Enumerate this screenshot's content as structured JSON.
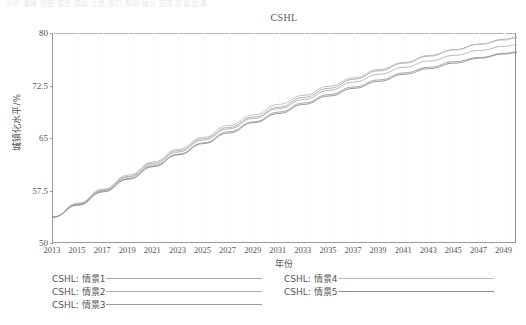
{
  "window": {
    "top_strip_text": "文件  编辑  视图  模型  模拟  工具  窗口  帮助                    输出  图表  变量  结果"
  },
  "chart_data": {
    "type": "line",
    "title": "CSHL",
    "xlabel": "年份",
    "ylabel": "城镇化水平/%",
    "xlim": [
      2013,
      2050
    ],
    "ylim": [
      50,
      80
    ],
    "yticks": [
      50,
      57.5,
      65,
      72.5,
      80
    ],
    "ytick_labels": [
      "50",
      "57.5",
      "65",
      "72.5",
      "80"
    ],
    "xticks": [
      2013,
      2015,
      2017,
      2019,
      2021,
      2023,
      2025,
      2027,
      2029,
      2031,
      2033,
      2035,
      2037,
      2039,
      2041,
      2043,
      2045,
      2047,
      2049
    ],
    "xtick_labels": [
      "2013",
      "2015",
      "2017",
      "2019",
      "2021",
      "2023",
      "2025",
      "2027",
      "2029",
      "2031",
      "2033",
      "2035",
      "2037",
      "2039",
      "2041",
      "2043",
      "2045",
      "2047",
      "2049"
    ],
    "grid": "vertical-faint",
    "legend_position": "below-two-columns",
    "x": [
      2013,
      2015,
      2017,
      2019,
      2021,
      2023,
      2025,
      2027,
      2029,
      2031,
      2033,
      2035,
      2037,
      2039,
      2041,
      2043,
      2045,
      2047,
      2049,
      2050
    ],
    "series": [
      {
        "name": "CSHL: 情景1",
        "color": "#a8a8a8",
        "values": [
          53.7,
          55.6,
          57.6,
          59.5,
          61.4,
          63.2,
          64.9,
          66.5,
          68.0,
          69.4,
          70.8,
          72.1,
          73.4,
          74.6,
          75.7,
          76.7,
          77.6,
          78.4,
          79.1,
          79.4
        ]
      },
      {
        "name": "CSHL: 情景2",
        "color": "#b2b2b2",
        "values": [
          53.7,
          55.5,
          57.5,
          59.4,
          61.2,
          63.0,
          64.7,
          66.3,
          67.8,
          69.2,
          70.5,
          71.8,
          73.0,
          74.1,
          75.1,
          76.0,
          76.8,
          77.5,
          78.1,
          78.3
        ]
      },
      {
        "name": "CSHL: 情景3",
        "color": "#9e9e9e",
        "values": [
          53.7,
          55.5,
          57.4,
          59.2,
          61.0,
          62.7,
          64.3,
          65.9,
          67.3,
          68.7,
          70.0,
          71.2,
          72.3,
          73.3,
          74.3,
          75.1,
          75.9,
          76.5,
          77.1,
          77.3
        ]
      },
      {
        "name": "CSHL: 情景4",
        "color": "#bbbbbb",
        "values": [
          53.7,
          55.7,
          57.7,
          59.7,
          61.6,
          63.4,
          65.1,
          66.8,
          68.3,
          69.8,
          71.1,
          72.4,
          73.6,
          74.8,
          75.8,
          76.8,
          77.6,
          78.4,
          79.0,
          79.3
        ]
      },
      {
        "name": "CSHL: 情景5",
        "color": "#8f8f8f",
        "values": [
          53.7,
          55.4,
          57.3,
          59.1,
          60.9,
          62.6,
          64.2,
          65.7,
          67.2,
          68.5,
          69.8,
          71.0,
          72.1,
          73.1,
          74.1,
          74.9,
          75.7,
          76.4,
          77.0,
          77.2
        ]
      }
    ]
  },
  "legend": {
    "columns": [
      {
        "entries": [
          "CSHL: 情景1",
          "CSHL: 情景2",
          "CSHL: 情景3"
        ]
      },
      {
        "entries": [
          "CSHL: 情景4",
          "CSHL: 情景5"
        ]
      }
    ]
  }
}
